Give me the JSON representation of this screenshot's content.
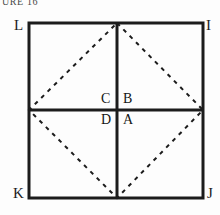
{
  "figure": {
    "caption": "URE 16",
    "background_color": "#fdfdfd",
    "ink_color": "#1c1c1c",
    "square": {
      "left": 29,
      "top": 23,
      "right": 203,
      "bottom": 198,
      "stroke_width": 3
    },
    "cross": {
      "vertical_x": 117,
      "horizontal_y": 110,
      "stroke_width": 3
    },
    "diamond": {
      "style": "dashed",
      "dash_pattern": "4 5",
      "stroke_width": 2
    },
    "vertices": [
      {
        "id": "label-L",
        "text": "L",
        "position": "top-left"
      },
      {
        "id": "label-I",
        "text": "I",
        "position": "top-right"
      },
      {
        "id": "label-J",
        "text": "J",
        "position": "bottom-right"
      },
      {
        "id": "label-K",
        "text": "K",
        "position": "bottom-left"
      }
    ],
    "quadrant_labels": [
      {
        "id": "label-C",
        "text": "C",
        "position": "upper-left-of-center"
      },
      {
        "id": "label-B",
        "text": "B",
        "position": "upper-right-of-center"
      },
      {
        "id": "label-D",
        "text": "D",
        "position": "lower-left-of-center"
      },
      {
        "id": "label-A",
        "text": "A",
        "position": "lower-right-of-center"
      }
    ]
  }
}
